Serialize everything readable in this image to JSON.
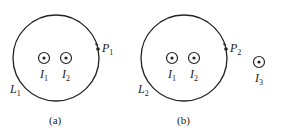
{
  "figure_a": {
    "caption": "(a)",
    "loop_label": "L",
    "loop_sub": "1",
    "point_label": "P",
    "point_sub": "1",
    "currents": [
      {
        "label": "I",
        "sub": "1"
      },
      {
        "label": "I",
        "sub": "2"
      }
    ]
  },
  "figure_b": {
    "caption": "(b)",
    "loop_label": "L",
    "loop_sub": "2",
    "point_label": "P",
    "point_sub": "2",
    "currents": [
      {
        "label": "I",
        "sub": "1"
      },
      {
        "label": "I",
        "sub": "2"
      },
      {
        "label": "I",
        "sub": "3"
      }
    ]
  },
  "colors": {
    "stroke": "#222222",
    "background": "#ffffff"
  }
}
